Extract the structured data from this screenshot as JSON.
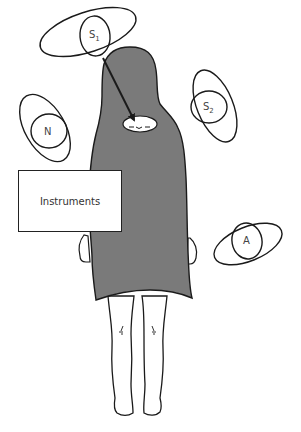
{
  "diagram": {
    "type": "operating-room-layout",
    "colors": {
      "drape": "#7a7a7a",
      "outline": "#1a1a1a",
      "label": "#444444",
      "background": "#ffffff"
    },
    "patient": {
      "description": "draped patient figure, head opening at top, legs exposed below drape"
    },
    "positions": [
      {
        "id": "S1",
        "letter": "S",
        "subscript": "1"
      },
      {
        "id": "S2",
        "letter": "S",
        "subscript": "2"
      },
      {
        "id": "N",
        "letter": "N",
        "subscript": ""
      },
      {
        "id": "A",
        "letter": "A",
        "subscript": ""
      }
    ],
    "instruments": {
      "label": "Instruments"
    },
    "arrow": {
      "from": "S1",
      "to": "face-opening"
    }
  }
}
